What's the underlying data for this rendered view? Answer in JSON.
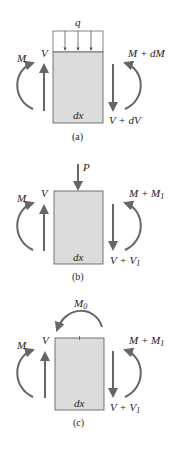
{
  "colors": {
    "element_fill": "#dcdcdc",
    "element_stroke": "#555555",
    "arrow": "#666666",
    "text": "#222222"
  },
  "panels": [
    {
      "caption": "(a)",
      "load_label": "q",
      "left_moment": "M",
      "left_shear": "V",
      "right_moment": "M + dM",
      "right_shear": "V + dV",
      "element_label": "dx"
    },
    {
      "caption": "(b)",
      "load_label": "P",
      "left_moment": "M",
      "left_shear": "V",
      "right_moment_base": "M + M",
      "right_moment_sub": "1",
      "right_shear_base": "V + V",
      "right_shear_sub": "1",
      "element_label": "dx"
    },
    {
      "caption": "(c)",
      "load_label_base": "M",
      "load_label_sub": "0",
      "left_moment": "M",
      "left_shear": "V",
      "right_moment_base": "M + M",
      "right_moment_sub": "1",
      "right_shear_base": "V + V",
      "right_shear_sub": "1",
      "element_label": "dx"
    }
  ]
}
